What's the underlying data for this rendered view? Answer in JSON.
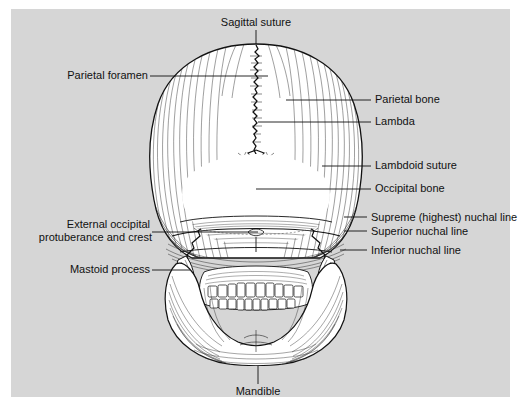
{
  "figure": {
    "background_color": "#d6d6d6",
    "frame_color": "#ffffff",
    "ink_color": "#111111",
    "bone_fill": "#ffffff"
  },
  "labels": {
    "sagittal_suture": "Sagittal suture",
    "parietal_foramen": "Parietal foramen",
    "parietal_bone": "Parietal bone",
    "lambda": "Lambda",
    "lambdoid_suture": "Lambdoid suture",
    "occipital_bone": "Occipital bone",
    "supreme_nuchal_line": "Supreme (highest) nuchal line",
    "superior_nuchal_line": "Superior nuchal line",
    "inferior_nuchal_line": "Inferior nuchal line",
    "external_occipital_line1": "External occipital",
    "external_occipital_line2": "protuberance and crest",
    "mastoid_process": "Mastoid process",
    "mandible": "Mandible"
  }
}
